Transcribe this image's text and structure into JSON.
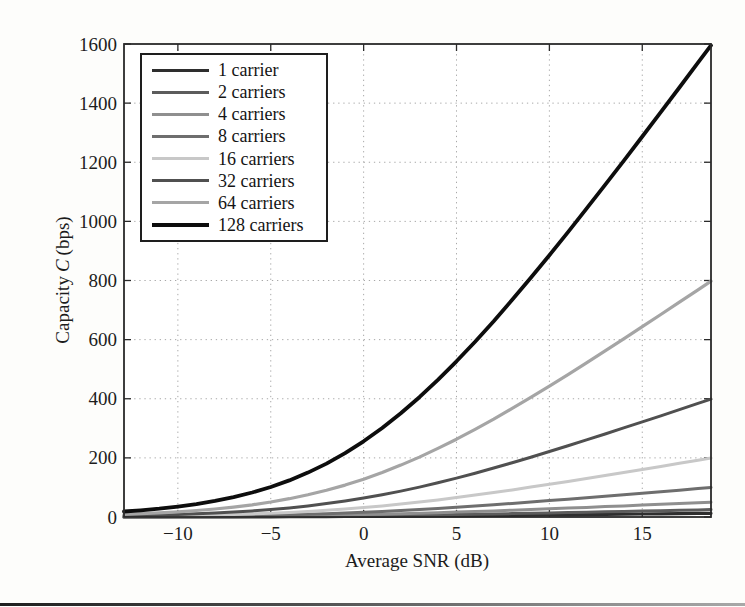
{
  "page": {
    "background": "#fdfdfb"
  },
  "chart_data": {
    "type": "line",
    "title": "",
    "xlabel": "Average SNR (dB)",
    "ylabel": {
      "pre": "Capacity",
      "var": "C",
      "post": "(bps)"
    },
    "ylabel_full": "Capacity C (bps)",
    "xlim": [
      -12.9,
      18.7
    ],
    "ylim": [
      0,
      1600
    ],
    "x_ticks": [
      -10,
      -5,
      0,
      5,
      10,
      15
    ],
    "y_ticks": [
      0,
      200,
      400,
      600,
      800,
      1000,
      1200,
      1400,
      1600
    ],
    "grid": true,
    "grid_style": "dotted",
    "grid_color": "#a8a8a8",
    "axis_color": "#2a2a2a",
    "legend_position": "top-left",
    "x": [
      -12.9,
      -12,
      -11,
      -10,
      -9,
      -8,
      -7,
      -6,
      -5,
      -4,
      -3,
      -2,
      -1,
      0,
      1,
      2,
      3,
      4,
      5,
      6,
      7,
      8,
      9,
      10,
      11,
      12,
      13,
      14,
      15,
      16,
      17,
      18,
      18.7
    ],
    "series": [
      {
        "name": "1 carrier",
        "carriers": 1,
        "color": "#2e2e2e",
        "lw": 3.2,
        "values": [
          0.14,
          0.18,
          0.22,
          0.28,
          0.34,
          0.42,
          0.52,
          0.65,
          0.79,
          0.97,
          1.17,
          1.41,
          1.69,
          2,
          2.35,
          2.74,
          3.17,
          3.62,
          4.11,
          4.63,
          5.18,
          5.74,
          6.32,
          6.92,
          7.53,
          8.15,
          8.78,
          9.41,
          10.06,
          10.7,
          11.35,
          12.01,
          12.46
        ]
      },
      {
        "name": "2 carriers",
        "carriers": 2,
        "color": "#5c5c5c",
        "lw": 3,
        "values": [
          0.29,
          0.35,
          0.44,
          0.55,
          0.68,
          0.85,
          1.05,
          1.29,
          1.59,
          1.93,
          2.34,
          2.82,
          3.37,
          4,
          4.7,
          5.48,
          6.33,
          7.25,
          8.23,
          9.27,
          10.35,
          11.48,
          12.64,
          13.84,
          15.06,
          16.3,
          17.56,
          18.83,
          20.11,
          21.4,
          22.7,
          24.01,
          24.93
        ]
      },
      {
        "name": "4 carriers",
        "carriers": 4,
        "color": "#8f8f8f",
        "lw": 3,
        "values": [
          0.58,
          0.71,
          0.88,
          1.1,
          1.37,
          1.7,
          2.1,
          2.59,
          3.17,
          3.87,
          4.69,
          5.65,
          6.75,
          8,
          9.41,
          10.96,
          12.66,
          14.5,
          16.46,
          18.53,
          20.7,
          22.96,
          25.29,
          27.68,
          30.12,
          32.6,
          35.11,
          37.66,
          40.22,
          42.81,
          45.41,
          48.02,
          49.85
        ]
      },
      {
        "name": "8 carriers",
        "carriers": 8,
        "color": "#6e6e6e",
        "lw": 3,
        "values": [
          1.15,
          1.41,
          1.76,
          2.2,
          2.74,
          3.4,
          4.2,
          5.17,
          6.34,
          7.74,
          9.38,
          11.29,
          13.5,
          16,
          18.81,
          21.93,
          25.32,
          29,
          32.92,
          37.06,
          41.4,
          45.92,
          50.57,
          55.35,
          60.23,
          65.19,
          70.23,
          75.32,
          80.45,
          85.61,
          90.81,
          96.04,
          99.7
        ]
      },
      {
        "name": "16 carriers",
        "carriers": 16,
        "color": "#c8c8c8",
        "lw": 3,
        "values": [
          2.31,
          2.83,
          3.53,
          4.4,
          5.47,
          6.79,
          8.4,
          10.35,
          12.69,
          15.47,
          18.76,
          22.58,
          26.99,
          32,
          37.62,
          43.85,
          50.65,
          57.99,
          65.84,
          74.13,
          82.81,
          91.83,
          101.15,
          110.7,
          120.46,
          130.39,
          140.45,
          150.63,
          160.89,
          171.23,
          181.63,
          192.08,
          199.4
        ]
      },
      {
        "name": "32 carriers",
        "carriers": 32,
        "color": "#505050",
        "lw": 3,
        "values": [
          4.62,
          5.65,
          7.06,
          8.8,
          10.95,
          13.58,
          16.8,
          20.69,
          25.37,
          30.94,
          37.51,
          45.17,
          53.98,
          64,
          75.25,
          87.7,
          101.29,
          115.98,
          131.67,
          148.25,
          165.62,
          183.66,
          202.3,
          221.4,
          240.93,
          260.78,
          280.9,
          301.26,
          321.79,
          342.45,
          363.25,
          384.16,
          398.8
        ]
      },
      {
        "name": "64 carriers",
        "carriers": 64,
        "color": "#a5a5a5",
        "lw": 3.2,
        "values": [
          9.24,
          11.3,
          14.11,
          17.6,
          21.9,
          27.17,
          33.6,
          41.38,
          50.74,
          61.89,
          75.02,
          90.33,
          107.96,
          128,
          150.5,
          175.41,
          202.58,
          231.97,
          263.34,
          296.5,
          331.24,
          367.32,
          404.59,
          442.81,
          481.86,
          521.55,
          561.81,
          602.53,
          643.58,
          684.9,
          726.5,
          768.32,
          797.61
        ]
      },
      {
        "name": "128 carriers",
        "carriers": 128,
        "color": "#0d0d0d",
        "lw": 3.8,
        "values": [
          18.47,
          22.6,
          28.22,
          35.2,
          43.79,
          54.34,
          67.19,
          82.77,
          101.49,
          123.78,
          150.04,
          180.67,
          215.92,
          256,
          301,
          350.81,
          405.17,
          463.93,
          526.69,
          593.01,
          662.48,
          734.64,
          809.18,
          885.61,
          963.71,
          1043.1,
          1123.61,
          1205.05,
          1287.16,
          1369.8,
          1453.01,
          1536.64,
          1595.21
        ]
      }
    ]
  }
}
